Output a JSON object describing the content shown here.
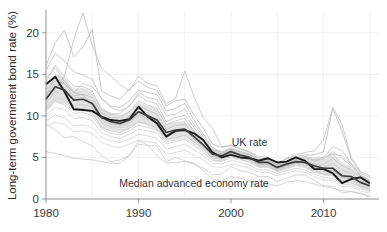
{
  "chart_data": {
    "type": "line",
    "title": "",
    "subtitle": "",
    "xlabel": "",
    "ylabel": "Long-term government bond rate (%)",
    "xlim": [
      1980,
      2016
    ],
    "ylim": [
      0,
      22.5
    ],
    "xticks": [
      1980,
      1990,
      2000,
      2010
    ],
    "xtick_labels": [
      "1980",
      "1990",
      "2000",
      "2010"
    ],
    "yticks": [
      0,
      5,
      10,
      15,
      20
    ],
    "ytick_labels": [
      "0",
      "5",
      "10",
      "15",
      "20"
    ],
    "grid": true,
    "grid_color": "#ececec",
    "legend_position": "inline-annotations",
    "annotations": [
      {
        "text": "UK rate",
        "x": 2002.0,
        "y": 6.4,
        "color": "#333333"
      },
      {
        "text": "Median advanced economy rate",
        "x": 1996.0,
        "y": 1.5,
        "color": "#333333"
      }
    ],
    "colors": {
      "uk_rate": "#1a1a1a",
      "median_rate": "#3d3d3d",
      "country_lines": "#b0b0b0",
      "ribbon": "#dedede",
      "background": "#ffffff",
      "axis": "#8a8a8a",
      "text": "#2b2b2b"
    },
    "x": [
      1980,
      1981,
      1982,
      1983,
      1984,
      1985,
      1986,
      1987,
      1988,
      1989,
      1990,
      1991,
      1992,
      1993,
      1994,
      1995,
      1996,
      1997,
      1998,
      1999,
      2000,
      2001,
      2002,
      2003,
      2004,
      2005,
      2006,
      2007,
      2008,
      2009,
      2010,
      2011,
      2012,
      2013,
      2014,
      2015
    ],
    "ribbon": {
      "name": "Interquartile range of advanced economy rates",
      "lower": [
        10.4,
        11.6,
        11.4,
        10.6,
        10.7,
        10.3,
        8.6,
        8.3,
        8.1,
        8.4,
        9.2,
        8.8,
        8.3,
        7.0,
        7.2,
        7.5,
        6.8,
        5.9,
        4.8,
        4.7,
        5.3,
        4.9,
        4.6,
        4.0,
        4.0,
        3.4,
        3.8,
        4.2,
        4.0,
        3.4,
        3.0,
        3.0,
        2.2,
        2.2,
        1.5,
        1.1
      ],
      "upper": [
        13.6,
        15.0,
        14.6,
        13.3,
        13.4,
        12.8,
        11.0,
        10.4,
        10.1,
        10.6,
        11.6,
        11.2,
        10.8,
        9.0,
        9.3,
        9.4,
        8.4,
        7.1,
        6.0,
        5.8,
        6.2,
        5.8,
        5.5,
        4.8,
        4.8,
        4.2,
        4.6,
        4.9,
        5.0,
        4.8,
        4.7,
        5.6,
        4.4,
        3.8,
        2.8,
        2.4
      ]
    },
    "series": [
      {
        "name": "UK rate",
        "highlight": true,
        "color": "#1a1a1a",
        "width": 1.9,
        "values": [
          13.8,
          14.7,
          12.9,
          10.8,
          10.7,
          10.6,
          9.9,
          9.5,
          9.4,
          9.6,
          11.1,
          9.9,
          9.1,
          7.5,
          8.2,
          8.3,
          7.9,
          7.1,
          5.6,
          5.0,
          5.3,
          5.0,
          4.9,
          4.6,
          4.9,
          4.4,
          4.5,
          5.0,
          4.6,
          3.6,
          3.6,
          3.1,
          1.9,
          2.4,
          2.6,
          1.9
        ]
      },
      {
        "name": "Median advanced economy rate",
        "highlight": true,
        "color": "#3d3d3d",
        "width": 1.7,
        "values": [
          12.0,
          13.5,
          13.1,
          11.9,
          12.0,
          11.5,
          9.8,
          9.3,
          9.1,
          9.5,
          10.5,
          10.0,
          9.5,
          8.0,
          8.3,
          8.4,
          7.5,
          6.5,
          5.4,
          5.2,
          5.7,
          5.3,
          5.0,
          4.4,
          4.4,
          3.8,
          4.2,
          4.5,
          4.4,
          4.0,
          3.7,
          3.7,
          2.8,
          2.7,
          2.0,
          1.6
        ]
      },
      {
        "name": "country-line-1",
        "highlight": false,
        "color": "#b4b4b4",
        "width": 0.8,
        "values": [
          16.0,
          18.8,
          20.3,
          17.1,
          18.3,
          20.4,
          13.0,
          12.4,
          12.0,
          13.2,
          14.2,
          13.4,
          13.1,
          11.2,
          11.8,
          12.0,
          10.1,
          8.5,
          6.6,
          6.2,
          6.5,
          6.0,
          5.6,
          4.9,
          4.9,
          4.2,
          4.8,
          5.1,
          5.3,
          5.3,
          5.7,
          10.9,
          8.2,
          4.8,
          3.1,
          2.6
        ]
      },
      {
        "name": "country-line-2",
        "highlight": false,
        "color": "#b8b8b8",
        "width": 0.8,
        "values": [
          15.5,
          17.5,
          16.6,
          15.3,
          14.9,
          14.4,
          12.0,
          11.2,
          11.0,
          11.8,
          13.1,
          12.8,
          12.6,
          10.6,
          10.9,
          11.5,
          9.5,
          7.8,
          6.2,
          5.6,
          6.1,
          5.7,
          5.4,
          4.7,
          4.7,
          4.0,
          4.4,
          4.9,
          5.1,
          4.9,
          5.0,
          6.3,
          5.8,
          4.3,
          2.9,
          2.3
        ]
      },
      {
        "name": "country-line-3",
        "highlight": false,
        "color": "#bdbdbd",
        "width": 0.8,
        "values": [
          14.0,
          16.1,
          14.7,
          13.6,
          13.5,
          13.0,
          10.8,
          10.2,
          10.3,
          11.2,
          12.5,
          11.8,
          11.4,
          9.3,
          9.8,
          10.1,
          8.6,
          7.2,
          5.9,
          5.4,
          5.8,
          5.4,
          5.1,
          4.5,
          4.5,
          3.9,
          4.3,
          4.7,
          4.8,
          4.6,
          4.8,
          5.7,
          4.9,
          4.0,
          2.7,
          2.1
        ]
      },
      {
        "name": "country-line-4",
        "highlight": false,
        "color": "#c0c0c0",
        "width": 0.8,
        "values": [
          13.2,
          14.2,
          13.8,
          12.4,
          12.6,
          12.2,
          10.4,
          9.8,
          9.8,
          10.5,
          11.8,
          11.3,
          10.9,
          8.9,
          9.4,
          9.7,
          8.2,
          6.9,
          5.7,
          5.3,
          5.7,
          5.3,
          5.0,
          4.4,
          4.4,
          3.8,
          4.2,
          4.6,
          4.6,
          4.2,
          4.2,
          4.9,
          4.0,
          3.5,
          2.5,
          2.0
        ]
      },
      {
        "name": "country-line-5",
        "highlight": false,
        "color": "#c4c4c4",
        "width": 0.8,
        "values": [
          12.6,
          13.8,
          13.3,
          12.1,
          12.2,
          11.8,
          10.0,
          9.4,
          9.3,
          9.9,
          11.2,
          10.7,
          10.2,
          8.4,
          8.8,
          9.0,
          7.8,
          6.6,
          5.5,
          5.1,
          5.5,
          5.2,
          4.9,
          4.3,
          4.3,
          3.7,
          4.1,
          4.5,
          4.4,
          3.9,
          3.8,
          4.3,
          3.4,
          3.1,
          2.2,
          1.8
        ]
      },
      {
        "name": "country-line-6",
        "highlight": false,
        "color": "#c8c8c8",
        "width": 0.8,
        "values": [
          11.5,
          12.9,
          12.6,
          11.2,
          11.4,
          11.0,
          9.2,
          8.7,
          8.6,
          9.1,
          10.2,
          9.8,
          9.4,
          7.8,
          8.1,
          8.4,
          7.2,
          6.2,
          5.1,
          4.9,
          5.3,
          5.0,
          4.7,
          4.1,
          4.1,
          3.5,
          3.9,
          4.3,
          4.2,
          3.7,
          3.4,
          3.4,
          2.5,
          2.4,
          1.8,
          1.4
        ]
      },
      {
        "name": "country-line-7",
        "highlight": false,
        "color": "#c8c8c8",
        "width": 0.8,
        "values": [
          11.0,
          12.2,
          11.9,
          10.8,
          10.9,
          10.4,
          8.6,
          8.2,
          8.0,
          8.5,
          9.3,
          9.0,
          8.6,
          7.2,
          7.4,
          7.7,
          6.9,
          6.0,
          4.9,
          4.8,
          5.3,
          5.0,
          4.7,
          4.0,
          4.0,
          3.4,
          3.8,
          4.2,
          4.0,
          3.4,
          3.1,
          3.0,
          2.2,
          2.2,
          1.6,
          1.2
        ]
      },
      {
        "name": "country-line-8",
        "highlight": false,
        "color": "#cccccc",
        "width": 0.8,
        "values": [
          10.1,
          11.0,
          10.8,
          9.7,
          9.8,
          9.4,
          8.0,
          7.5,
          7.3,
          7.8,
          8.4,
          8.2,
          7.9,
          6.6,
          6.9,
          7.2,
          6.4,
          5.6,
          4.6,
          4.5,
          5.0,
          4.7,
          4.4,
          3.8,
          3.8,
          3.3,
          3.6,
          4.0,
          3.8,
          3.2,
          2.9,
          2.8,
          2.0,
          1.9,
          1.4,
          1.0
        ]
      },
      {
        "name": "country-line-9",
        "highlight": false,
        "color": "#cfcfcf",
        "width": 0.8,
        "values": [
          9.4,
          10.1,
          9.8,
          8.8,
          8.9,
          8.6,
          7.4,
          7.0,
          6.8,
          7.2,
          7.8,
          7.6,
          7.3,
          6.0,
          6.3,
          6.6,
          5.9,
          5.2,
          4.3,
          4.2,
          4.7,
          4.4,
          4.1,
          3.5,
          3.5,
          3.1,
          3.4,
          3.7,
          3.5,
          3.0,
          2.6,
          2.5,
          1.8,
          1.7,
          1.2,
          0.9
        ]
      },
      {
        "name": "country-line-10",
        "highlight": false,
        "color": "#d2d2d2",
        "width": 0.8,
        "values": [
          8.8,
          9.2,
          9.0,
          8.1,
          8.2,
          7.9,
          6.8,
          6.4,
          6.2,
          6.6,
          7.1,
          6.9,
          6.7,
          5.4,
          5.6,
          5.9,
          5.3,
          4.7,
          3.9,
          3.8,
          4.2,
          4.0,
          3.7,
          3.2,
          3.2,
          2.8,
          3.1,
          3.4,
          3.2,
          2.7,
          2.3,
          2.2,
          1.5,
          1.5,
          1.0,
          0.7
        ]
      },
      {
        "name": "country-line-11",
        "highlight": false,
        "color": "#c6c6c6",
        "width": 0.8,
        "values": [
          9.0,
          8.3,
          7.4,
          7.5,
          6.9,
          6.4,
          5.2,
          4.5,
          4.7,
          5.2,
          7.0,
          6.5,
          5.2,
          4.3,
          4.4,
          4.5,
          4.3,
          3.4,
          2.4,
          2.2,
          2.7,
          2.5,
          2.2,
          1.5,
          1.8,
          1.6,
          2.0,
          2.2,
          2.1,
          1.8,
          1.5,
          1.3,
          1.0,
          0.9,
          0.6,
          0.4
        ]
      },
      {
        "name": "country-line-12",
        "highlight": false,
        "color": "#c6c6c6",
        "width": 0.8,
        "values": [
          5.7,
          5.5,
          5.2,
          4.9,
          4.8,
          4.7,
          4.5,
          4.3,
          4.3,
          5.2,
          6.6,
          6.4,
          6.4,
          4.5,
          5.0,
          4.6,
          4.2,
          3.7,
          2.9,
          3.0,
          3.9,
          3.4,
          3.2,
          2.7,
          2.7,
          2.1,
          2.5,
          2.9,
          2.9,
          2.2,
          1.6,
          1.5,
          0.7,
          0.9,
          0.7,
          0.2
        ]
      },
      {
        "name": "country-line-13",
        "highlight": false,
        "color": "#bababa",
        "width": 0.8,
        "values": [
          12.2,
          14.9,
          13.9,
          12.8,
          12.5,
          11.2,
          9.6,
          9.0,
          8.9,
          9.4,
          10.1,
          9.6,
          9.1,
          7.7,
          8.0,
          8.2,
          7.3,
          6.4,
          5.2,
          5.0,
          5.5,
          5.1,
          4.8,
          4.2,
          4.2,
          3.6,
          4.0,
          4.4,
          4.3,
          3.8,
          3.5,
          3.5,
          2.6,
          2.6,
          1.9,
          1.5
        ]
      },
      {
        "name": "country-line-14",
        "highlight": false,
        "color": "#bfbfbf",
        "width": 0.8,
        "values": [
          14.5,
          15.8,
          14.2,
          12.8,
          13.9,
          13.5,
          12.2,
          11.0,
          10.6,
          11.1,
          12.8,
          12.2,
          12.0,
          10.0,
          10.2,
          10.8,
          9.0,
          7.5,
          6.1,
          5.5,
          6.0,
          5.6,
          5.3,
          4.6,
          4.6,
          4.1,
          4.5,
          4.8,
          5.0,
          4.7,
          4.9,
          5.4,
          5.2,
          4.2,
          2.8,
          2.2
        ]
      },
      {
        "name": "country-line-15",
        "highlight": false,
        "color": "#bcbcbc",
        "width": 0.8,
        "values": [
          12.8,
          13.1,
          14.8,
          19.2,
          22.4,
          18.5,
          15.7,
          14.8,
          13.8,
          13.0,
          14.8,
          13.9,
          13.6,
          11.5,
          12.1,
          15.4,
          12.3,
          9.8,
          8.5,
          6.3,
          6.4,
          6.1,
          5.7,
          5.1,
          5.0,
          4.3,
          4.9,
          5.3,
          5.6,
          5.8,
          7.1,
          11.0,
          9.0,
          5.0,
          3.3,
          2.8
        ]
      },
      {
        "name": "country-line-16",
        "highlight": false,
        "color": "#cacaca",
        "width": 0.8,
        "values": [
          10.8,
          11.8,
          11.3,
          10.3,
          10.4,
          10.0,
          8.4,
          7.9,
          7.7,
          8.2,
          8.9,
          8.6,
          8.3,
          6.9,
          7.1,
          7.4,
          6.6,
          5.8,
          4.7,
          4.6,
          5.1,
          4.8,
          4.5,
          3.9,
          3.9,
          3.4,
          3.7,
          4.1,
          3.9,
          3.3,
          3.0,
          2.9,
          2.1,
          2.0,
          1.5,
          1.1
        ]
      }
    ]
  },
  "axis": {
    "ylabel": "Long-term government bond rate (%)",
    "xtick_labels": [
      "1980",
      "1990",
      "2000",
      "2010"
    ],
    "ytick_labels": [
      "0",
      "5",
      "10",
      "15",
      "20"
    ]
  },
  "annotations": {
    "uk_rate_label": "UK rate",
    "median_label": "Median advanced economy rate"
  }
}
